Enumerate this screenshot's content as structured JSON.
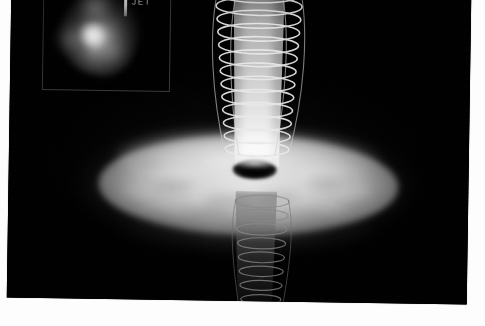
{
  "image": {
    "title": "Black hole accretion disk with bipolar helical jet",
    "medium": "grayscale astronomical illustration photograph",
    "background_color": "#fdfdfd",
    "plate_color": "#000000",
    "plate_rotation_deg": 0.85,
    "width": 485,
    "height": 326
  },
  "scene": {
    "accretion_disk": {
      "name": "accretion-disk",
      "shape": "ellipse",
      "center_x": 240,
      "center_y": 190,
      "radius_x": 150,
      "radius_y": 50,
      "color_bright": "#eeeeee",
      "color_mid": "#c4c4c4",
      "color_edge": "#5c5c5c",
      "mottles": [
        {
          "x": 150,
          "y": 186,
          "w": 34,
          "h": 11,
          "opacity": 0.34
        },
        {
          "x": 196,
          "y": 200,
          "w": 42,
          "h": 12,
          "opacity": 0.4
        },
        {
          "x": 252,
          "y": 196,
          "w": 38,
          "h": 11,
          "opacity": 0.36
        },
        {
          "x": 300,
          "y": 182,
          "w": 30,
          "h": 10,
          "opacity": 0.3
        },
        {
          "x": 176,
          "y": 214,
          "w": 46,
          "h": 12,
          "opacity": 0.26
        },
        {
          "x": 284,
          "y": 214,
          "w": 40,
          "h": 11,
          "opacity": 0.24
        },
        {
          "x": 128,
          "y": 166,
          "w": 26,
          "h": 9,
          "opacity": 0.22
        },
        {
          "x": 330,
          "y": 204,
          "w": 28,
          "h": 10,
          "opacity": 0.22
        },
        {
          "x": 214,
          "y": 226,
          "w": 36,
          "h": 10,
          "opacity": 0.2
        }
      ],
      "highlights": [
        {
          "x": 140,
          "y": 172,
          "w": 48,
          "h": 16,
          "opacity": 0.3
        },
        {
          "x": 286,
          "y": 168,
          "w": 52,
          "h": 17,
          "opacity": 0.32
        },
        {
          "x": 196,
          "y": 160,
          "w": 40,
          "h": 13,
          "opacity": 0.28
        },
        {
          "x": 322,
          "y": 188,
          "w": 40,
          "h": 14,
          "opacity": 0.22
        },
        {
          "x": 112,
          "y": 192,
          "w": 36,
          "h": 13,
          "opacity": 0.2
        }
      ]
    },
    "black_hole": {
      "name": "black-hole-shadow",
      "center_x": 246,
      "center_y": 174,
      "radius_x": 22,
      "radius_y": 10,
      "color": "#000000"
    },
    "jet_upper": {
      "name": "relativistic-jet-upper",
      "direction": "up",
      "top_y": -6,
      "bottom_y": 172,
      "width_top": 58,
      "width_bottom": 44,
      "brightness": "bright"
    },
    "jet_lower": {
      "name": "counter-jet-lower",
      "direction": "down",
      "top_y": 196,
      "bottom_y": 308,
      "width_top": 52,
      "width_bottom": 36,
      "brightness": "dim"
    },
    "helix_upper": {
      "name": "magnetic-field-helix-upper",
      "turns": 13,
      "stroke_color": "#e9e9e9",
      "stroke_width": 1.6
    },
    "helix_lower": {
      "name": "magnetic-field-helix-lower",
      "turns": 8,
      "stroke_color": "#8a8a8a",
      "stroke_width": 1.2
    }
  },
  "inset": {
    "name": "radio-observation-inset",
    "x": 32,
    "y": -8,
    "width": 126,
    "height": 104,
    "border_color": "#3a3a3a",
    "background_color": "#000000",
    "annotation": {
      "label": "JET",
      "label_color": "#bdbdbd",
      "marker": "vertical-bar-with-arrowhead",
      "marker_color": "#e8e8e8"
    },
    "source_blob": {
      "name": "radio-source-blob",
      "core_color": "#ffffff",
      "halo_color": "#b0b0b0",
      "lobes": 3
    }
  }
}
